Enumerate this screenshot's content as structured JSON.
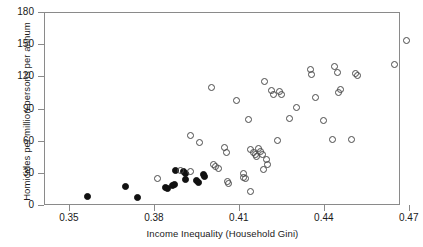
{
  "chart_data": {
    "type": "scatter",
    "title": "",
    "xlabel": "Income Inequality (Household Gini)",
    "ylabel": "Homicides per million persons per annum",
    "xlim": [
      0.3412,
      0.4669
    ],
    "ylim": [
      0,
      180
    ],
    "xticks": [
      0.35,
      0.38,
      0.41,
      0.44,
      0.47
    ],
    "xtick_labels": [
      "0.35",
      "0.38",
      "0.41",
      "0.44",
      "0.47"
    ],
    "yticks": [
      0,
      30,
      60,
      90,
      120,
      150,
      180
    ],
    "ytick_labels": [
      "0",
      "30",
      "60",
      "90",
      "120",
      "150",
      "180"
    ],
    "grid": false,
    "legend": null,
    "series": [
      {
        "name": "filled-markers",
        "marker": "filled-circle",
        "color": "#111111",
        "points": [
          [
            0.3565,
            8
          ],
          [
            0.37,
            17
          ],
          [
            0.3742,
            7
          ],
          [
            0.384,
            16
          ],
          [
            0.3848,
            15
          ],
          [
            0.3866,
            18
          ],
          [
            0.3872,
            19
          ],
          [
            0.3877,
            32
          ],
          [
            0.3905,
            31
          ],
          [
            0.391,
            29
          ],
          [
            0.3912,
            24
          ],
          [
            0.3952,
            23
          ],
          [
            0.3958,
            21
          ],
          [
            0.3975,
            28
          ],
          [
            0.398,
            27
          ]
        ]
      },
      {
        "name": "open-markers",
        "marker": "open-circle",
        "color": "#4a4a4a",
        "points": [
          [
            0.3812,
            25
          ],
          [
            0.3893,
            32
          ],
          [
            0.3928,
            65
          ],
          [
            0.393,
            31
          ],
          [
            0.3962,
            58
          ],
          [
            0.4005,
            110
          ],
          [
            0.401,
            38
          ],
          [
            0.4018,
            36
          ],
          [
            0.4028,
            34
          ],
          [
            0.405,
            54
          ],
          [
            0.4058,
            49
          ],
          [
            0.406,
            22
          ],
          [
            0.4065,
            20
          ],
          [
            0.4092,
            97
          ],
          [
            0.4115,
            29
          ],
          [
            0.4118,
            26
          ],
          [
            0.4122,
            25
          ],
          [
            0.4135,
            80
          ],
          [
            0.414,
            52
          ],
          [
            0.4142,
            13
          ],
          [
            0.4152,
            49
          ],
          [
            0.4158,
            47
          ],
          [
            0.4162,
            45
          ],
          [
            0.417,
            53
          ],
          [
            0.4178,
            50
          ],
          [
            0.4182,
            47
          ],
          [
            0.4188,
            33
          ],
          [
            0.4192,
            115
          ],
          [
            0.4198,
            42
          ],
          [
            0.4202,
            38
          ],
          [
            0.4215,
            107
          ],
          [
            0.4222,
            103
          ],
          [
            0.4238,
            60
          ],
          [
            0.4245,
            106
          ],
          [
            0.4252,
            103
          ],
          [
            0.4278,
            81
          ],
          [
            0.4302,
            91
          ],
          [
            0.4352,
            126
          ],
          [
            0.4358,
            122
          ],
          [
            0.4372,
            100
          ],
          [
            0.4398,
            79
          ],
          [
            0.4432,
            61
          ],
          [
            0.4438,
            129
          ],
          [
            0.4448,
            124
          ],
          [
            0.4452,
            105
          ],
          [
            0.4458,
            108
          ],
          [
            0.4498,
            61
          ],
          [
            0.4512,
            123
          ],
          [
            0.4518,
            121
          ],
          [
            0.4648,
            131
          ],
          [
            0.4692,
            153
          ]
        ]
      }
    ]
  },
  "caption_fragment": ""
}
